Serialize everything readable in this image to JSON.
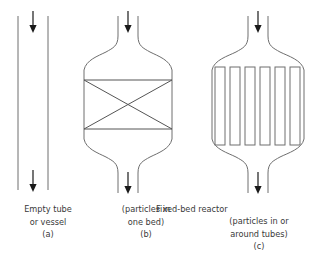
{
  "figure": {
    "title": "Fixed-bed reactor",
    "background_color": "#ffffff",
    "line_color": "#6e6e6e",
    "arrow_color": "#1a1a1a",
    "text_color": "#3a3a3a"
  },
  "panels": [
    {
      "key": "a",
      "letter": "(a)",
      "label_line1": "Empty tube",
      "label_line2": "or vessel",
      "vessel_type": "straight-tube",
      "inlet_arrow": "down-arrow-icon",
      "outlet_arrow": "down-arrow-icon",
      "internals": "none",
      "tube_count": 0
    },
    {
      "key": "b",
      "letter": "(b)",
      "label_line1": "(particles in",
      "label_line2": "one bed)",
      "vessel_type": "flared-vessel",
      "inlet_arrow": "down-arrow-icon",
      "outlet_arrow": "down-arrow-icon",
      "internals": "single-bed-cross",
      "tube_count": 0
    },
    {
      "key": "c",
      "letter": "(c)",
      "label_line1": "(particles in or",
      "label_line2": "around tubes)",
      "vessel_type": "flared-vessel",
      "inlet_arrow": "down-arrow-icon",
      "outlet_arrow": "down-arrow-icon",
      "internals": "vertical-tubes",
      "tube_count": 6
    }
  ]
}
